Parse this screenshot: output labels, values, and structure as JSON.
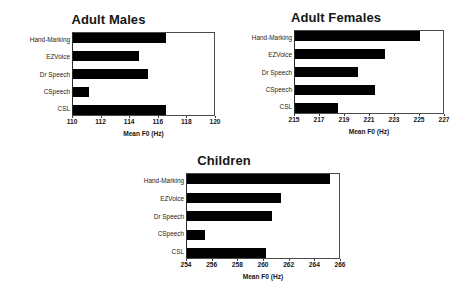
{
  "figure": {
    "panels": [
      "males",
      "females",
      "children"
    ]
  },
  "males": {
    "title": "Adult Males",
    "xlabel": "Mean F0 (Hz)",
    "categories": [
      "Hand-Marking",
      "EZVoice",
      "Dr Speech",
      "CSpeech",
      "CSL"
    ],
    "ticks": [
      "110",
      "112",
      "114",
      "116",
      "118",
      "120"
    ]
  },
  "females": {
    "title": "Adult Females",
    "xlabel": "Mean F0 (Hz)",
    "categories": [
      "Hand-Marking",
      "EZVoice",
      "Dr Speech",
      "CSpeech",
      "CSL"
    ],
    "ticks": [
      "215",
      "217",
      "219",
      "221",
      "223",
      "225",
      "227"
    ]
  },
  "children": {
    "title": "Children",
    "xlabel": "Mean F0 (Hz)",
    "categories": [
      "Hand-Marking",
      "EZVoice",
      "Dr Speech",
      "CSpeech",
      "CSL"
    ],
    "ticks": [
      "254",
      "256",
      "258",
      "260",
      "262",
      "264",
      "266"
    ]
  },
  "chart_data": [
    {
      "type": "bar",
      "orientation": "horizontal",
      "title": "Adult Males",
      "xlabel": "Mean F0 (Hz)",
      "ylabel": "",
      "categories": [
        "Hand-Marking",
        "EZVoice",
        "Dr Speech",
        "CSpeech",
        "CSL"
      ],
      "values": [
        116.6,
        114.7,
        115.3,
        111.1,
        116.6
      ],
      "xlim": [
        110,
        120
      ],
      "xticks": [
        110,
        112,
        114,
        116,
        118,
        120
      ],
      "grid": false,
      "legend": "none",
      "bar_color": "#000000"
    },
    {
      "type": "bar",
      "orientation": "horizontal",
      "title": "Adult Females",
      "xlabel": "Mean F0 (Hz)",
      "ylabel": "",
      "categories": [
        "Hand-Marking",
        "EZVoice",
        "Dr Speech",
        "CSpeech",
        "CSL"
      ],
      "values": [
        225.1,
        222.3,
        220.1,
        221.5,
        218.5
      ],
      "xlim": [
        215,
        227
      ],
      "xticks": [
        215,
        217,
        219,
        221,
        223,
        225,
        227
      ],
      "grid": false,
      "legend": "none",
      "bar_color": "#000000"
    },
    {
      "type": "bar",
      "orientation": "horizontal",
      "title": "Children",
      "xlabel": "Mean F0 (Hz)",
      "ylabel": "",
      "categories": [
        "Hand-Marking",
        "EZVoice",
        "Dr Speech",
        "CSpeech",
        "CSL"
      ],
      "values": [
        265.3,
        261.4,
        260.7,
        255.4,
        260.2
      ],
      "xlim": [
        254,
        266
      ],
      "xticks": [
        254,
        256,
        258,
        260,
        262,
        264,
        266
      ],
      "grid": false,
      "legend": "none",
      "bar_color": "#000000"
    }
  ]
}
